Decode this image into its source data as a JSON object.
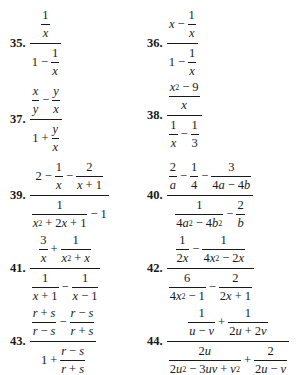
{
  "page": {
    "section": "Complex fractions exercises",
    "problems": [
      {
        "number": "35.",
        "expression": "(1/x) / (1 - 1/x)"
      },
      {
        "number": "36.",
        "expression": "(x - 1/x) / (1 - 1/x)"
      },
      {
        "number": "37.",
        "expression": "(x/y - y/x) / (1 + y/x)"
      },
      {
        "number": "38.",
        "expression": "((x^2 - 9)/x) / (1/x - 1/3)"
      },
      {
        "number": "39.",
        "expression": "(2 - 1/x - 2/(x + 1)) / (1/(x^2 + 2x + 1) - 1)"
      },
      {
        "number": "40.",
        "expression": "(2/a - 1/4 - 3/(4a - 4b)) / (1/(4a^2 - 4b^2) - 2/b)"
      },
      {
        "number": "41.",
        "expression": "(3/x + 1/(x^2 + x)) / (1/(x + 1) - 1/(x - 1))"
      },
      {
        "number": "42.",
        "expression": "(1/(2x) - 1/(4x^2 - 2x)) / (6/(4x^2 - 1) - 2/(2x + 1))"
      },
      {
        "number": "43.",
        "expression": "((r + s)/(r - s) - (r - s)/(r + s)) / (1 + (r - s)/(r + s))"
      },
      {
        "number": "44.",
        "expression": "(1/(u - v) + 1/(2u + 2v)) / (2u/(2u^2 - 3uv + v^2) + 2/(2u - v))"
      }
    ]
  },
  "tokens": {
    "one": "1",
    "two": "2",
    "three": "3",
    "four": "4",
    "six": "6",
    "nine": "9",
    "x": "x",
    "y": "y",
    "a": "a",
    "b": "b",
    "r": "r",
    "s": "s",
    "u": "u",
    "v": "v",
    "minus": "−",
    "plus": "+"
  }
}
